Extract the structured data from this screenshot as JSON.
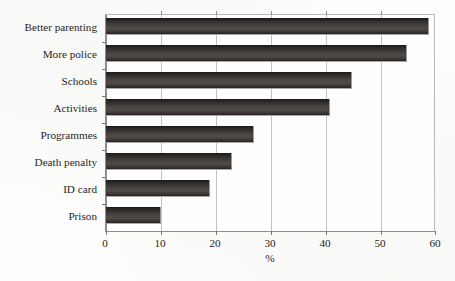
{
  "chart_data": {
    "type": "bar",
    "orientation": "horizontal",
    "title": "",
    "subtitle": "",
    "xlabel": "%",
    "ylabel": "",
    "categories": [
      "Better parenting",
      "More police",
      "Schools",
      "Activities",
      "Programmes",
      "Death penalty",
      "ID card",
      "Prison"
    ],
    "values": [
      59,
      55,
      45,
      41,
      27,
      23,
      19,
      10
    ],
    "xlim": [
      0,
      60
    ],
    "xticks": [
      0,
      10,
      20,
      30,
      40,
      50,
      60
    ],
    "xtick_labels": [
      "0",
      "10",
      "20",
      "30",
      "40",
      "50",
      "60"
    ],
    "grid": true,
    "grid_axis": "x",
    "legend": false,
    "legend_position": "none",
    "bar_color": "#3a3633",
    "grid_color": "#c3c3c3",
    "axis_color": "#7a7a7a",
    "background_color": "#fdfdfc"
  }
}
